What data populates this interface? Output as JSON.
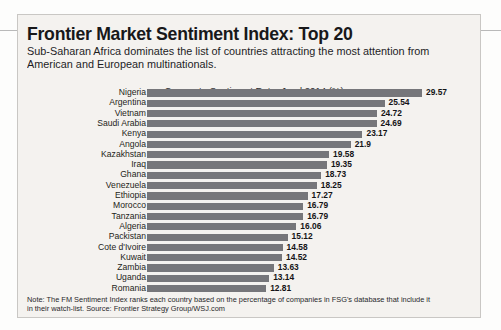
{
  "headline": "Frontier Market Sentiment Index: Top 20",
  "subtitle": "Sub-Saharan Africa dominates the list of countries attracting the most attention from American and European multinationals.",
  "note_line1": "Note: The FM Sentiment Index ranks each country based on the percentage of companies in FSG's database that include it",
  "note_line2": "in their watch-list.   Source: Frontier Strategy Group/WSJ.com",
  "colors": {
    "bar": "#76767a",
    "panel_bg": "#f4f2ef",
    "panel_border": "#c9c7c4",
    "text": "#1e1e20"
  },
  "chart_data": {
    "type": "bar",
    "orientation": "horizontal",
    "title": "Corporate Sentiment Rate, Jund 2014 (%)",
    "xlabel": "",
    "ylabel": "",
    "xlim": [
      0,
      29.57
    ],
    "grid": false,
    "legend": false,
    "categories": [
      "Nigeria",
      "Argentina",
      "Vietnam",
      "Saudi Arabia",
      "Kenya",
      "Angola",
      "Kazakhstan",
      "Iraq",
      "Ghana",
      "Venezuela",
      "Ethiopia",
      "Morocco",
      "Tanzania",
      "Algeria",
      "Packistan",
      "Cote d'Ivoire",
      "Kuwait",
      "Zambia",
      "Uganda",
      "Romania"
    ],
    "values": [
      29.57,
      25.54,
      24.72,
      24.69,
      23.17,
      21.9,
      19.58,
      19.35,
      18.73,
      18.25,
      17.27,
      16.79,
      16.79,
      16.06,
      15.12,
      14.58,
      14.52,
      13.63,
      13.14,
      12.81
    ],
    "value_labels": [
      "29.57",
      "25.54",
      "24.72",
      "24.69",
      "23.17",
      "21.9",
      "19.58",
      "19.35",
      "18.73",
      "18.25",
      "17.27",
      "16.79",
      "16.79",
      "16.06",
      "15.12",
      "14.58",
      "14.52",
      "13.63",
      "13.14",
      "12.81"
    ]
  }
}
